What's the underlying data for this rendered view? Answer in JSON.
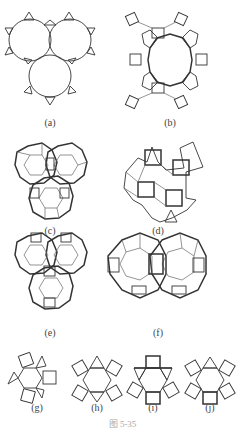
{
  "figure": {
    "caption": "图 5-35",
    "panels": [
      {
        "id": "a",
        "label": "(a)",
        "description": "Three mutually tangent circles with small triangles on their outer boundary"
      },
      {
        "id": "b",
        "label": "(b)",
        "description": "Central dodecagon ring surrounded by alternating squares and hexagons forming a flower"
      },
      {
        "id": "c",
        "label": "(c)",
        "description": "Three overlapping dodecagonal rosettes (squares and triangles around hexagon)"
      },
      {
        "id": "d",
        "label": "(d)",
        "description": "Irregular patch of squares and triangles with protruding triangles"
      },
      {
        "id": "e",
        "label": "(e)",
        "description": "Three overlapping dodecagonal rosettes, alternate arrangement"
      },
      {
        "id": "f",
        "label": "(f)",
        "description": "Two overlapping large dodecagonal rosettes side by side"
      },
      {
        "id": "g",
        "label": "(g)",
        "description": "Hexagon with alternating squares and triangles attached"
      },
      {
        "id": "h",
        "label": "(h)",
        "description": "Hexagon with four squares and two triangles"
      },
      {
        "id": "i",
        "label": "(i)",
        "description": "Hexagon with squares top/bottom and triangles at sides"
      },
      {
        "id": "j",
        "label": "(j)",
        "description": "Hexagon with five squares and one triangle"
      }
    ]
  }
}
